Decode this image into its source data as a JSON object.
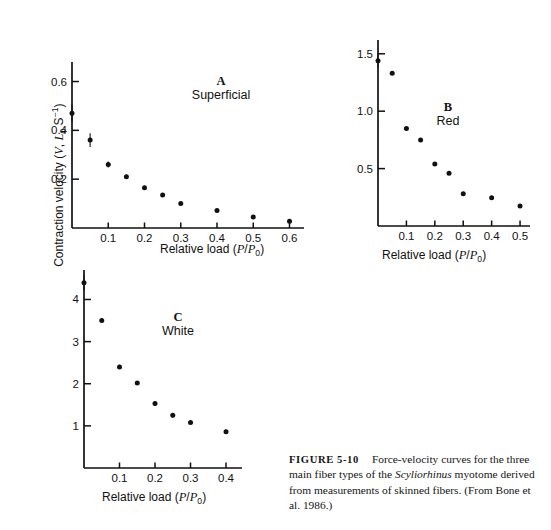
{
  "figure": {
    "number_label": "FIGURE 5-10",
    "caption_text": "Force-velocity curves for the three main fiber types of the ",
    "caption_species": "Scyliorhinus",
    "caption_text_2": " myotome derived from measurements of skinned fibers. (From Bone et al. 1986.)"
  },
  "axes": {
    "y_label_prefix": "Contraction velocity (",
    "y_label_v": "V",
    "y_label_comma": ", ",
    "y_label_l": "L",
    "y_label_l_sub": "0",
    "y_label_s": " S",
    "y_label_s_sup": "−1",
    "y_label_suffix": ")",
    "x_label_prefix": "Relative load (",
    "x_label_p1": "P",
    "x_label_slash": "/",
    "x_label_p2": "P",
    "x_label_p2_sub": "0",
    "x_label_suffix": ")"
  },
  "chart_data": [
    {
      "id": "A",
      "type": "scatter",
      "title": "A",
      "subtitle": "Superficial",
      "xlabel": "Relative load (P/P0)",
      "ylabel": "Contraction velocity (V, L0 S-1)",
      "xlim": [
        0,
        0.64
      ],
      "ylim": [
        0,
        0.68
      ],
      "xticks": [
        0.1,
        0.2,
        0.3,
        0.4,
        0.5,
        0.6
      ],
      "xticklabels": [
        "0.1",
        "0.2",
        "0.3",
        "0.4",
        "0.5",
        "0.6"
      ],
      "yticks": [
        0.2,
        0.4,
        0.6
      ],
      "yticklabels": [
        "0.2",
        "0.4",
        "0.6"
      ],
      "grid": false,
      "legend": "none",
      "x": [
        0.0,
        0.05,
        0.1,
        0.15,
        0.2,
        0.25,
        0.3,
        0.4,
        0.5,
        0.6
      ],
      "y": [
        0.47,
        0.36,
        0.26,
        0.21,
        0.165,
        0.135,
        0.1,
        0.072,
        0.045,
        0.028
      ],
      "yerr": [
        0.035,
        0.028,
        0.012,
        0.008,
        0.008,
        0.006,
        0.006,
        0.005,
        0.004,
        0.004
      ]
    },
    {
      "id": "B",
      "type": "scatter",
      "title": "B",
      "subtitle": "Red",
      "xlabel": "Relative load (P/P0)",
      "ylabel": "Contraction velocity (V, L0 S-1)",
      "xlim": [
        0,
        0.535
      ],
      "ylim": [
        0,
        1.62
      ],
      "xticks": [
        0.1,
        0.2,
        0.3,
        0.4,
        0.5
      ],
      "xticklabels": [
        "0.1",
        "0.2",
        "0.3",
        "0.4",
        "0.5"
      ],
      "yticks": [
        0.5,
        1.0,
        1.5
      ],
      "yticklabels": [
        "0.5",
        "1.0",
        "1.5"
      ],
      "grid": false,
      "legend": "none",
      "x": [
        0.0,
        0.05,
        0.1,
        0.15,
        0.2,
        0.25,
        0.3,
        0.4,
        0.5
      ],
      "y": [
        1.44,
        1.33,
        0.85,
        0.75,
        0.54,
        0.46,
        0.28,
        0.245,
        0.175
      ],
      "yerr": [
        0.06,
        0.0,
        0.0,
        0.0,
        0.0,
        0.0,
        0.0,
        0.0,
        0.0
      ]
    },
    {
      "id": "C",
      "type": "scatter",
      "title": "C",
      "subtitle": "White",
      "xlabel": "Relative load (P/P0)",
      "ylabel": "Contraction velocity (V, L0 S-1)",
      "xlim": [
        0,
        0.445
      ],
      "ylim": [
        0,
        4.7
      ],
      "xticks": [
        0.1,
        0.2,
        0.3,
        0.4
      ],
      "xticklabels": [
        "0.1",
        "0.2",
        "0.3",
        "0.4"
      ],
      "yticks": [
        1,
        2,
        3,
        4
      ],
      "yticklabels": [
        "1",
        "2",
        "3",
        "4"
      ],
      "grid": false,
      "legend": "none",
      "x": [
        0.0,
        0.05,
        0.1,
        0.15,
        0.2,
        0.25,
        0.3,
        0.4
      ],
      "y": [
        4.4,
        3.5,
        2.4,
        2.02,
        1.53,
        1.25,
        1.08,
        0.86
      ],
      "yerr": [
        0.18,
        0.0,
        0.05,
        0.0,
        0.06,
        0.05,
        0.05,
        0.05
      ]
    }
  ]
}
